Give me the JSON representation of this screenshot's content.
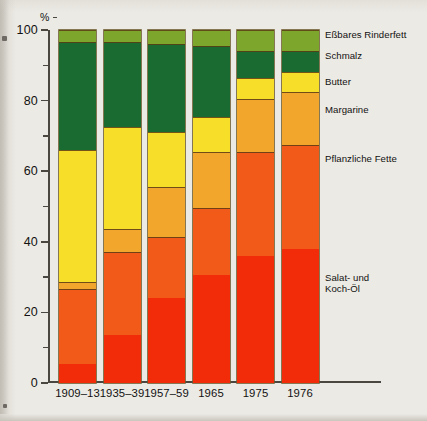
{
  "chart_data": {
    "type": "bar",
    "stacked": true,
    "stacked_mode": "percent",
    "title": "",
    "xlabel": "",
    "ylabel": "%",
    "ylim": [
      0,
      100
    ],
    "yticks_major": [
      0,
      20,
      40,
      60,
      80,
      100
    ],
    "yticks_minor": [
      10,
      30,
      50,
      70,
      90
    ],
    "grid": false,
    "legend_position": "right",
    "categories": [
      "1909–13",
      "1935–39",
      "1957–59",
      "1965",
      "1975",
      "1976"
    ],
    "series": [
      {
        "name": "Salat- und\nKoch-Öl",
        "color": "#F22B09",
        "values": [
          5.5,
          13.5,
          24.0,
          30.5,
          36.0,
          38.0
        ]
      },
      {
        "name": "Pflanzliche Fette",
        "color": "#F15A18",
        "values": [
          21.0,
          23.5,
          17.5,
          19.0,
          29.5,
          29.5
        ]
      },
      {
        "name": "Margarine",
        "color": "#F2A72C",
        "values": [
          2.0,
          6.5,
          14.0,
          16.0,
          15.0,
          15.0
        ]
      },
      {
        "name": "Butter",
        "color": "#F7DE29",
        "values": [
          37.5,
          29.0,
          15.5,
          10.0,
          6.0,
          5.5
        ]
      },
      {
        "name": "Schmalz",
        "color": "#1A6B31",
        "values": [
          30.5,
          24.0,
          25.0,
          20.0,
          7.5,
          6.0
        ]
      },
      {
        "name": "Eßbares Rinderfett",
        "color": "#7CA62C",
        "values": [
          3.5,
          3.5,
          4.0,
          4.5,
          6.0,
          6.0
        ]
      }
    ]
  },
  "axis": {
    "y_unit": "%",
    "tick_labels": [
      "100",
      "80",
      "60",
      "40",
      "20",
      "0"
    ]
  },
  "legend": {
    "items": [
      {
        "label": "Eßbares Rinderfett",
        "color": "#7CA62C"
      },
      {
        "label": "Schmalz",
        "color": "#1A6B31"
      },
      {
        "label": "Butter",
        "color": "#F7DE29"
      },
      {
        "label": "Margarine",
        "color": "#F2A72C"
      },
      {
        "label": "Pflanzliche Fette",
        "color": "#F15A18"
      },
      {
        "label": "Salat- und\nKoch-Öl",
        "color": "#F22B09"
      }
    ]
  }
}
